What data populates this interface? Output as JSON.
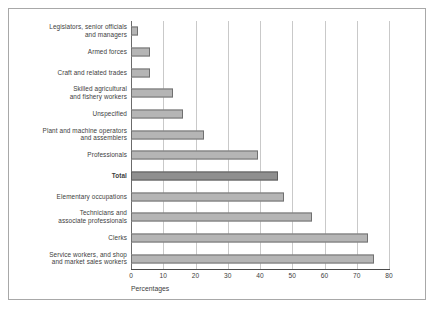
{
  "figure": {
    "frame_color": "#a8a8a8",
    "background": "#ffffff"
  },
  "axis": {
    "title": "Percentages",
    "ticks": [
      "0",
      "10",
      "20",
      "30",
      "40",
      "50",
      "60",
      "70",
      "80"
    ]
  },
  "chart_data": {
    "type": "bar",
    "orientation": "horizontal",
    "title": "",
    "xlabel": "Percentages",
    "ylabel": "",
    "xlim": [
      0,
      80
    ],
    "xticks": [
      0,
      10,
      20,
      30,
      40,
      50,
      60,
      70,
      80
    ],
    "grid": true,
    "legend": false,
    "bar_color": "#b5b5b5",
    "bar_edge_color": "#707070",
    "highlight_color": "#8f8f8f",
    "categories": [
      "Legislators, senior officials\nand managers",
      "Armed forces",
      "Craft and related trades",
      "Skilled agricultural\nand fishery workers",
      "Unspecified",
      "Plant and machine operators\nand assemblers",
      "Professionals",
      "Total",
      "Elementary occupations",
      "Technicians and\nassociate professionals",
      "Clerks",
      "Service workers, and shop\nand market sales workers"
    ],
    "values": [
      2.2,
      6.0,
      6.0,
      13.0,
      16.0,
      22.5,
      39.5,
      45.5,
      47.5,
      56.0,
      73.5,
      75.5
    ],
    "highlight_category": "Total"
  }
}
